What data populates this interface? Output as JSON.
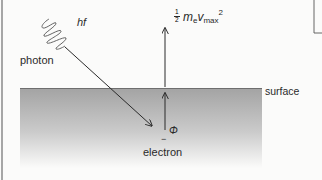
{
  "diagram": {
    "labels": {
      "photon_energy": "hf",
      "photon": "photon",
      "kinetic_energy": {
        "fraction_numerator": "1",
        "fraction_denominator": "2",
        "mass_symbol": "m",
        "mass_subscript": "e",
        "velocity_symbol": "v",
        "velocity_subscript": "max",
        "exponent": "2"
      },
      "surface": "surface",
      "work_function": "Φ",
      "electron_charge": "−",
      "electron": "electron"
    },
    "colors": {
      "surface_top": "#a6a6a6",
      "surface_bottom": "#ffffff",
      "surface_edge": "#6e6e6e",
      "ink": "#2a2a2a",
      "background": "#fbfbfa"
    }
  }
}
